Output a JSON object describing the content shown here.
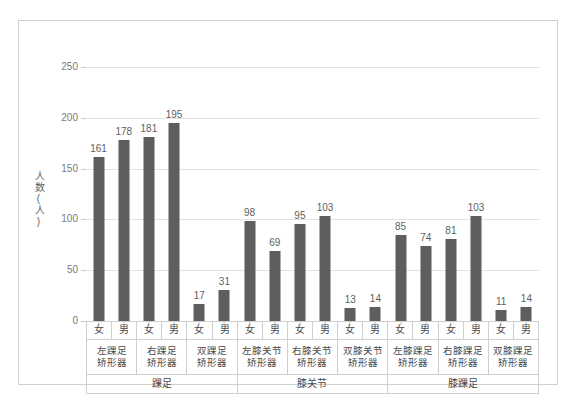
{
  "chart_data": {
    "type": "bar",
    "title": "",
    "xlabel": "",
    "ylabel": "人数(人)",
    "ylim": [
      0,
      250
    ],
    "yticks": [
      0,
      50,
      100,
      150,
      200,
      250
    ],
    "grid": true,
    "legend": null,
    "bar_color": "#5e5e5e",
    "categories": [
      "左踝足矫形器 女",
      "左踝足矫形器 男",
      "右踝足矫形器 女",
      "右踝足矫形器 男",
      "双踝足矫形器 女",
      "双踝足矫形器 男",
      "左膝关节矫形器 女",
      "左膝关节矫形器 男",
      "右膝关节矫形器 女",
      "右膝关节矫形器 男",
      "双膝关节矫形器 女",
      "双膝关节矫形器 男",
      "左膝踝足矫形器 女",
      "左膝踝足矫形器 男",
      "右膝踝足矫形器 女",
      "右膝踝足矫形器 男",
      "双膝踝足矫形器 女",
      "双膝踝足矫形器 男"
    ],
    "values": [
      161,
      178,
      181,
      195,
      17,
      31,
      98,
      69,
      95,
      103,
      13,
      14,
      85,
      74,
      81,
      103,
      11,
      14
    ],
    "groups": [
      {
        "category": "踝足",
        "products": [
          {
            "name": "左踝足\n矫形器",
            "line1": "左踝足",
            "line2": "矫形器",
            "bars": [
              {
                "gender": "女",
                "value": 161
              },
              {
                "gender": "男",
                "value": 178
              }
            ]
          },
          {
            "name": "右踝足\n矫形器",
            "line1": "右踝足",
            "line2": "矫形器",
            "bars": [
              {
                "gender": "女",
                "value": 181
              },
              {
                "gender": "男",
                "value": 195
              }
            ]
          },
          {
            "name": "双踝足\n矫形器",
            "line1": "双踝足",
            "line2": "矫形器",
            "bars": [
              {
                "gender": "女",
                "value": 17
              },
              {
                "gender": "男",
                "value": 31
              }
            ]
          }
        ]
      },
      {
        "category": "膝关节",
        "products": [
          {
            "name": "左膝关节\n矫形器",
            "line1": "左膝关节",
            "line2": "矫形器",
            "bars": [
              {
                "gender": "女",
                "value": 98
              },
              {
                "gender": "男",
                "value": 69
              }
            ]
          },
          {
            "name": "右膝关节\n矫形器",
            "line1": "右膝关节",
            "line2": "矫形器",
            "bars": [
              {
                "gender": "女",
                "value": 95
              },
              {
                "gender": "男",
                "value": 103
              }
            ]
          },
          {
            "name": "双膝关节\n矫形器",
            "line1": "双膝关节",
            "line2": "矫形器",
            "bars": [
              {
                "gender": "女",
                "value": 13
              },
              {
                "gender": "男",
                "value": 14
              }
            ]
          }
        ]
      },
      {
        "category": "膝踝足",
        "products": [
          {
            "name": "左膝踝足\n矫形器",
            "line1": "左膝踝足",
            "line2": "矫形器",
            "bars": [
              {
                "gender": "女",
                "value": 85
              },
              {
                "gender": "男",
                "value": 74
              }
            ]
          },
          {
            "name": "右膝踝足\n矫形器",
            "line1": "右膝踝足",
            "line2": "矫形器",
            "bars": [
              {
                "gender": "女",
                "value": 81
              },
              {
                "gender": "男",
                "value": 103
              }
            ]
          },
          {
            "name": "双膝踝足\n矫形器",
            "line1": "双膝踝足",
            "line2": "矫形器",
            "bars": [
              {
                "gender": "女",
                "value": 11
              },
              {
                "gender": "男",
                "value": 14
              }
            ]
          }
        ]
      }
    ]
  }
}
